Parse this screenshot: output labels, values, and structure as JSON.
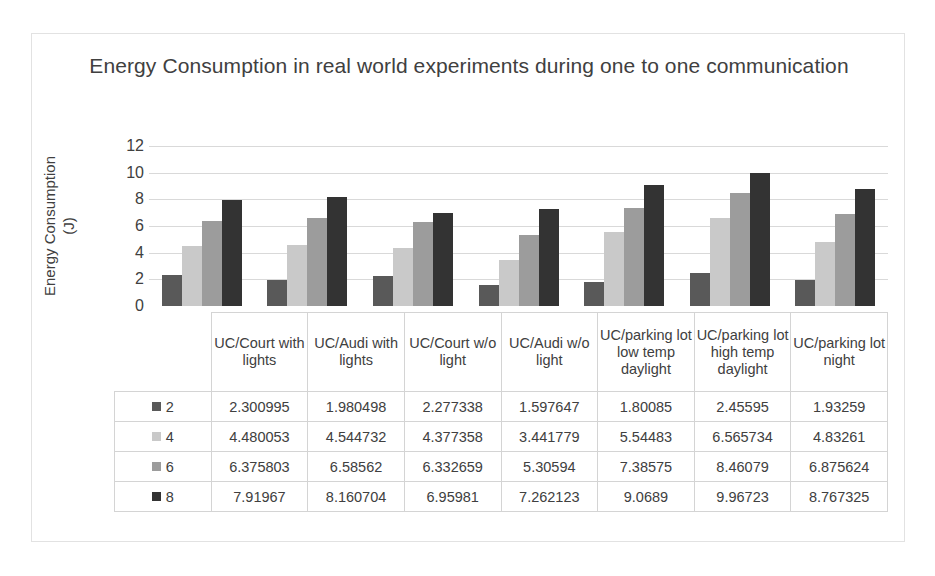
{
  "chart_data": {
    "type": "bar",
    "title": "Energy Consumption in real world experiments during one to one communication",
    "xlabel": "",
    "ylabel": "Energy Consumption\n(J)",
    "ylim": [
      0,
      12
    ],
    "ytick_labels": [
      "12",
      "10",
      "8",
      "6",
      "4",
      "2",
      "0"
    ],
    "ytick_values": [
      12,
      10,
      8,
      6,
      4,
      2,
      0
    ],
    "grid": true,
    "legend_position": "table-left",
    "categories": [
      "UC/Court with lights",
      "UC/Audi with lights",
      "UC/Court w/o light",
      "UC/Audi w/o light",
      "UC/parking lot low temp daylight",
      "UC/parking lot high temp daylight",
      "UC/parking lot  night"
    ],
    "series": [
      {
        "name": "2",
        "color": "#595959",
        "values": [
          2.300995,
          1.980498,
          2.277338,
          1.597647,
          1.80085,
          2.45595,
          1.93259
        ],
        "labels": [
          "2.300995",
          "1.980498",
          "2.277338",
          "1.597647",
          "1.80085",
          "2.45595",
          "1.93259"
        ]
      },
      {
        "name": "4",
        "color": "#c9c9c9",
        "values": [
          4.480053,
          4.544732,
          4.377358,
          3.441779,
          5.54483,
          6.565734,
          4.83261
        ],
        "labels": [
          "4.480053",
          "4.544732",
          "4.377358",
          "3.441779",
          "5.54483",
          "6.565734",
          "4.83261"
        ]
      },
      {
        "name": "6",
        "color": "#9c9c9c",
        "values": [
          6.375803,
          6.58562,
          6.332659,
          5.30594,
          7.38575,
          8.46079,
          6.875624
        ],
        "labels": [
          "6.375803",
          "6.58562",
          "6.332659",
          "5.30594",
          "7.38575",
          "8.46079",
          "6.875624"
        ]
      },
      {
        "name": "8",
        "color": "#333333",
        "values": [
          7.91967,
          8.160704,
          6.95981,
          7.262123,
          9.0689,
          9.96723,
          8.767325
        ],
        "labels": [
          "7.91967",
          "8.160704",
          "6.95981",
          "7.262123",
          "9.0689",
          "9.96723",
          "8.767325"
        ]
      }
    ]
  }
}
